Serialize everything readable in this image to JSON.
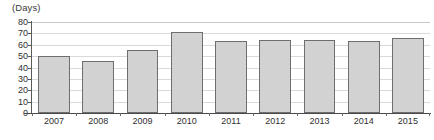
{
  "chart_data": {
    "type": "bar",
    "title": "",
    "subtitle": "",
    "unit_label": "(Days)",
    "xlabel": "",
    "ylabel": "Days",
    "categories": [
      "2007",
      "2008",
      "2009",
      "2010",
      "2011",
      "2012",
      "2013",
      "2014",
      "2015"
    ],
    "values": [
      50,
      46,
      55,
      71,
      63,
      64,
      64,
      63,
      66
    ],
    "ylim": [
      0,
      80
    ],
    "ytick_values": [
      0,
      10,
      20,
      30,
      40,
      50,
      60,
      70,
      80
    ],
    "ytick_labels": [
      "0",
      "10",
      "20",
      "30",
      "40",
      "50",
      "60",
      "70",
      "80"
    ],
    "grid": true,
    "grid_axis": "y",
    "legend": false,
    "legend_position": "none",
    "bar_fill_color": "#d2d2d2",
    "bar_border_color": "#6e6e6e",
    "gridline_color": "#d9d9d9",
    "axis_color": "#5a5a5a",
    "background_color": "#ffffff"
  }
}
